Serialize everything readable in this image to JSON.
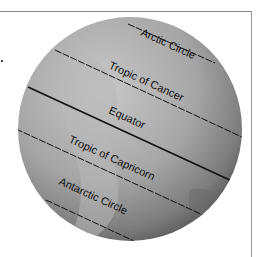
{
  "diagram": {
    "title": "",
    "colors": {
      "globe_light": "#c2c2c2",
      "globe_mid": "#9e9e9e",
      "globe_dark": "#5a5a5a",
      "line": "#111111",
      "frame": "#8a8a8a"
    },
    "latitude_lines": [
      {
        "name": "arctic",
        "label": "Arctic Circle",
        "style": "dashed"
      },
      {
        "name": "tropic-of-cancer",
        "label": "Tropic of Cancer",
        "style": "dashed"
      },
      {
        "name": "equator",
        "label": "Equator",
        "style": "solid"
      },
      {
        "name": "tropic-of-capricorn",
        "label": "Tropic of Capricorn",
        "style": "dashed"
      },
      {
        "name": "antarctic",
        "label": "Antarctic Circle",
        "style": "dashed"
      }
    ]
  }
}
